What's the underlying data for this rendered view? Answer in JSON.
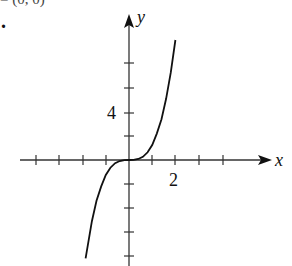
{
  "header": {
    "cut_text": "= (0, 0)",
    "item_marker": "."
  },
  "chart_data": {
    "type": "line",
    "title": "",
    "xlabel": "x",
    "ylabel": "y",
    "x_tick_labels": [
      {
        "value": 2,
        "label": "2"
      }
    ],
    "y_tick_labels": [
      {
        "value": 4,
        "label": "4"
      }
    ],
    "x_ticks": [
      -4,
      -3,
      -2,
      -1,
      1,
      2,
      3,
      4
    ],
    "y_ticks": [
      -8,
      -6,
      -4,
      -2,
      2,
      4,
      6,
      8
    ],
    "xlim": [
      -4.5,
      6.2
    ],
    "ylim": [
      -8.9,
      12
    ],
    "grid": false,
    "legend": null,
    "series": [
      {
        "name": "f(x) ≈ 1.25x³",
        "x": [
          -1.87,
          -1.6,
          -1.4,
          -1.2,
          -1.0,
          -0.8,
          -0.6,
          -0.4,
          -0.2,
          0,
          0.2,
          0.4,
          0.6,
          0.8,
          1.0,
          1.2,
          1.4,
          1.6,
          1.8,
          2.0
        ],
        "values": [
          -8.2,
          -5.1,
          -3.4,
          -2.2,
          -1.25,
          -0.64,
          -0.27,
          -0.08,
          -0.01,
          0,
          0.01,
          0.08,
          0.27,
          0.64,
          1.25,
          2.2,
          3.4,
          5.1,
          7.3,
          10.0
        ]
      }
    ],
    "annotations": [
      "y-axis arrow",
      "x-axis arrow",
      "curve passes through origin"
    ]
  },
  "labels": {
    "x_axis": "x",
    "y_axis": "y",
    "x_tick_2": "2",
    "y_tick_4": "4"
  },
  "colors": {
    "axis": "#333333",
    "curve": "#111111"
  }
}
